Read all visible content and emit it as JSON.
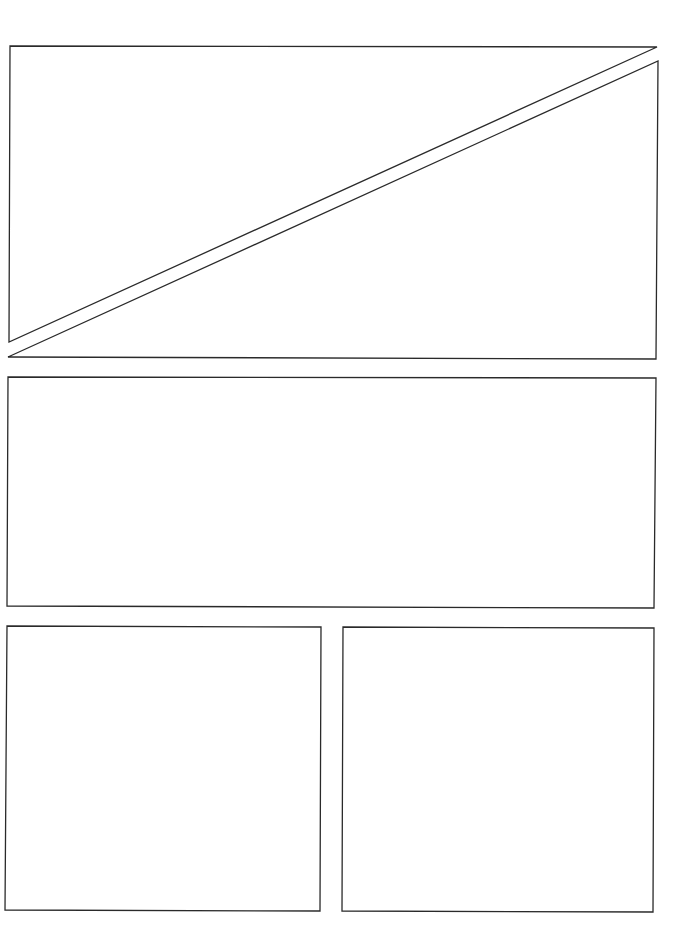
{
  "page": {
    "type": "comic-panel-template",
    "background": "#ffffff",
    "stroke_color": "#2a2a2a",
    "panel_count": 5
  },
  "panels": [
    {
      "id": "panel-1",
      "shape": "triangle",
      "points": "10,46 657,47 9,342"
    },
    {
      "id": "panel-2",
      "shape": "triangle",
      "points": "658,61 656,359 8,357"
    },
    {
      "id": "panel-3",
      "shape": "rect",
      "points": "8,377 656,378 654,608 7,606"
    },
    {
      "id": "panel-4",
      "shape": "rect",
      "points": "7,626 321,627 320,911 5,910"
    },
    {
      "id": "panel-5",
      "shape": "rect",
      "points": "343,627 654,628 653,912 342,911"
    }
  ]
}
